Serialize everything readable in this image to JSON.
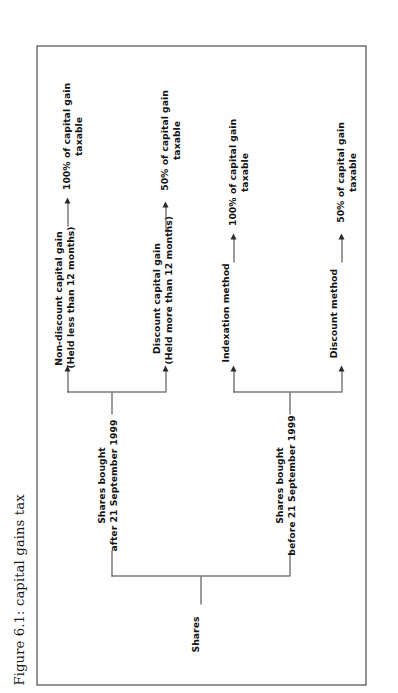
{
  "figure": {
    "caption": "Figure 6.1: capital gains tax"
  },
  "diagram": {
    "type": "tree",
    "orientation": "left-to-right (page rotated 90° counter-clockwise)",
    "root": {
      "label": "Shares"
    },
    "branches": [
      {
        "id": "before-1999",
        "label_line1": "Shares bought",
        "label_line2": "before 21 September 1999",
        "children": [
          {
            "id": "discount-method",
            "label_line1": "Discount method",
            "label_line2": "",
            "outcome_line1": "50% of capital gain",
            "outcome_line2": "taxable"
          },
          {
            "id": "indexation-method",
            "label_line1": "Indexation method",
            "label_line2": "",
            "outcome_line1": "100% of capital gain",
            "outcome_line2": "taxable"
          }
        ]
      },
      {
        "id": "after-1999",
        "label_line1": "Shares bought",
        "label_line2": "after 21 September 1999",
        "children": [
          {
            "id": "discount-capital-gain",
            "label_line1": "Discount capital gain",
            "label_line2": "(Held more than 12 months)",
            "outcome_line1": "50% of capital gain",
            "outcome_line2": "taxable"
          },
          {
            "id": "non-discount-capital-gain",
            "label_line1": "Non-discount capital gain",
            "label_line2": "(Held less than 12 months)",
            "outcome_line1": "100% of capital gain",
            "outcome_line2": "taxable"
          }
        ]
      }
    ]
  },
  "colors": {
    "text": "#121212",
    "line": "#3a3a3a",
    "frame": "#2b2b2b",
    "background": "#ffffff"
  }
}
